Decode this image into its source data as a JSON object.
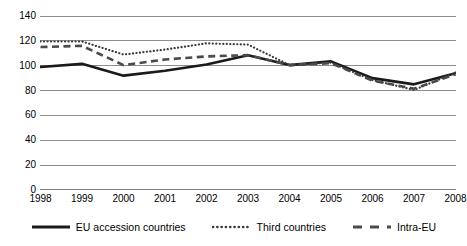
{
  "chart_data": {
    "type": "line",
    "title": "",
    "subtitle": "",
    "xlabel": "",
    "ylabel": "",
    "categories": [
      "1998",
      "1999",
      "2000",
      "2001",
      "2002",
      "2003",
      "2004",
      "2005",
      "2006",
      "2007",
      "2008"
    ],
    "x": [
      1998,
      1999,
      2000,
      2001,
      2002,
      2003,
      2004,
      2005,
      2006,
      2007,
      2008
    ],
    "xlim": [
      1998,
      2008
    ],
    "ylim": [
      0,
      140
    ],
    "y_ticks": [
      0,
      20,
      40,
      60,
      80,
      100,
      120,
      140
    ],
    "y_tick_labels": [
      "0",
      "20",
      "40",
      "60",
      "80",
      "100",
      "120",
      "140"
    ],
    "grid": "horizontal",
    "legend_position": "bottom",
    "series": [
      {
        "name": "EU accession countries",
        "style": "solid",
        "color": "#1a1a1a",
        "width": 2.6,
        "values": [
          99,
          101.5,
          92,
          96,
          101,
          108.5,
          100.5,
          103.5,
          90,
          85,
          94
        ]
      },
      {
        "name": "Third countries",
        "style": "dotted",
        "color": "#3a3a3a",
        "width": 2.2,
        "values": [
          119.5,
          119.5,
          109,
          113,
          118,
          117,
          100.5,
          102.5,
          88.5,
          80.5,
          94.5
        ]
      },
      {
        "name": "Intra-EU",
        "style": "dashed",
        "color": "#4a4a4a",
        "width": 2.6,
        "values": [
          115,
          116,
          100.5,
          105,
          107.5,
          108.5,
          100.5,
          102,
          88,
          81.5,
          93
        ]
      }
    ]
  },
  "legend": {
    "items": [
      {
        "label": "EU accession countries",
        "swatch": "solid-line-swatch"
      },
      {
        "label": "Third countries",
        "swatch": "dotted-line-swatch"
      },
      {
        "label": "Intra-EU",
        "swatch": "dashed-line-swatch"
      }
    ]
  },
  "colors": {
    "grid": "#808080",
    "axis_text": "#000000",
    "background": "#ffffff"
  }
}
